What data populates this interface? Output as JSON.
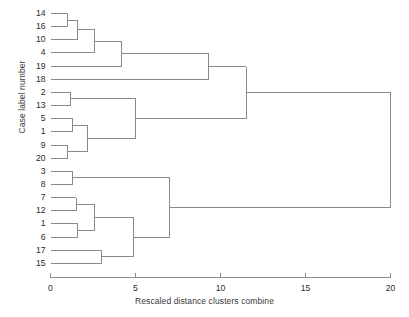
{
  "chart_data": {
    "type": "dendrogram",
    "title": "",
    "xlabel": "Rescaled distance clusters combine",
    "ylabel": "Case label number",
    "xlim": [
      0,
      20
    ],
    "xticks": [
      0,
      5,
      10,
      15,
      20
    ],
    "xtick_labels": [
      "0",
      "5",
      "10",
      "15",
      "20"
    ],
    "grid": false,
    "legend": "none",
    "leaf_labels": [
      "14",
      "16",
      "10",
      "4",
      "19",
      "18",
      "2",
      "13",
      "5",
      "1",
      "9",
      "20",
      "3",
      "8",
      "7",
      "12",
      "1",
      "6",
      "17",
      "15"
    ],
    "leaf_count": 20,
    "orientation": "horizontal",
    "merges": [
      {
        "id": "m1",
        "left": "14",
        "right": "16",
        "distance": 1.0
      },
      {
        "id": "m2",
        "left": "m1",
        "right": "10",
        "distance": 1.6
      },
      {
        "id": "m3",
        "left": "m2",
        "right": "4",
        "distance": 2.6
      },
      {
        "id": "m4",
        "left": "m3",
        "right": "19",
        "distance": 4.2
      },
      {
        "id": "m5",
        "left": "m4",
        "right": "18",
        "distance": 9.3
      },
      {
        "id": "m6",
        "left": "2",
        "right": "13",
        "distance": 1.2
      },
      {
        "id": "m7",
        "left": "5",
        "right": "1",
        "distance": 1.3
      },
      {
        "id": "m8",
        "left": "9",
        "right": "20",
        "distance": 1.0
      },
      {
        "id": "m9",
        "left": "m7",
        "right": "m8",
        "distance": 2.2
      },
      {
        "id": "m10",
        "left": "m6",
        "right": "m9",
        "distance": 5.0
      },
      {
        "id": "m11",
        "left": "m5",
        "right": "m10",
        "distance": 11.5
      },
      {
        "id": "m12",
        "left": "3",
        "right": "8",
        "distance": 1.3
      },
      {
        "id": "m13",
        "left": "7",
        "right": "12",
        "distance": 1.5
      },
      {
        "id": "m14",
        "left": "1b",
        "right": "6",
        "distance": 1.6
      },
      {
        "id": "m15",
        "left": "m13",
        "right": "m14",
        "distance": 2.6
      },
      {
        "id": "m16",
        "left": "17",
        "right": "15",
        "distance": 3.0
      },
      {
        "id": "m17",
        "left": "m15",
        "right": "m16",
        "distance": 4.9
      },
      {
        "id": "m18",
        "left": "m12",
        "right": "m17",
        "distance": 7.0
      },
      {
        "id": "m19",
        "left": "m11",
        "right": "m18",
        "distance": 20.0
      }
    ],
    "axis_color": "#8c8c8c",
    "line_color": "#8a8a8a"
  }
}
